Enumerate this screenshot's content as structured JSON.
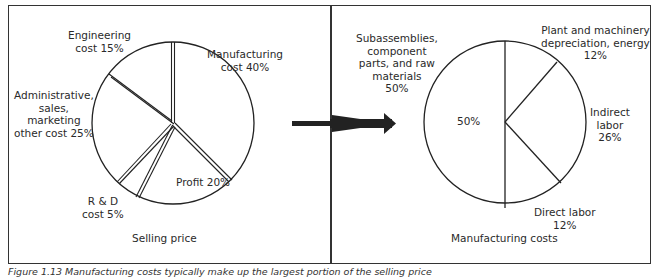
{
  "left_panel": {
    "title": "Selling price",
    "slices": [
      {
        "label_lines": [
          "Manufacturing",
          "cost 40%"
        ],
        "name": "Manufacturing cost",
        "value": 40
      },
      {
        "label_lines": [
          "Profit 20%"
        ],
        "name": "Profit",
        "value": 20
      },
      {
        "label_lines": [
          "R & D",
          "cost 5%"
        ],
        "name": "R & D cost",
        "value": 5
      },
      {
        "label_lines": [
          "Administrative,",
          "sales,",
          "marketing",
          "other cost 25%"
        ],
        "name": "Administrative, sales, marketing other cost",
        "value": 25
      },
      {
        "label_lines": [
          "Engineering",
          "cost 15%"
        ],
        "name": "Engineering cost",
        "value": 15
      }
    ]
  },
  "right_panel": {
    "title": "Manufacturing costs",
    "center_label": "50%",
    "slices": [
      {
        "label_lines": [
          "Plant and machinery",
          "depreciation, energy",
          "12%"
        ],
        "name": "Plant and machinery depreciation, energy",
        "value": 12
      },
      {
        "label_lines": [
          "Indirect",
          "labor",
          "26%"
        ],
        "name": "Indirect labor",
        "value": 26
      },
      {
        "label_lines": [
          "Direct labor",
          "12%"
        ],
        "name": "Direct labor",
        "value": 12
      },
      {
        "label_lines": [
          "Subassemblies,",
          "component",
          "parts, and raw",
          "materials",
          "50%"
        ],
        "name": "Subassemblies, component parts, and raw materials",
        "value": 50
      }
    ]
  },
  "caption": "Figure 1.13  Manufacturing costs typically make up the largest portion of the selling price"
}
